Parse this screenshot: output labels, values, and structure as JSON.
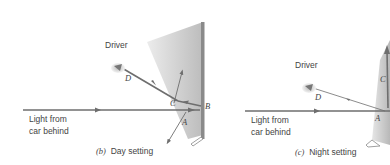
{
  "figure": {
    "panels": [
      {
        "id": "b",
        "caption_letter": "(b)",
        "caption_text": "Day setting",
        "driver_label": "Driver",
        "light_label_line1": "Light from",
        "light_label_line2": "car behind",
        "points": {
          "A": "A",
          "B": "B",
          "C": "C",
          "D": "D"
        }
      },
      {
        "id": "c",
        "caption_letter": "(c)",
        "caption_text": "Night setting",
        "driver_label": "Driver",
        "light_label_line1": "Light from",
        "light_label_line2": "car behind",
        "points": {
          "A": "A",
          "C": "C",
          "D": "D"
        }
      }
    ],
    "colors": {
      "ray": "#6e6e6e",
      "mirror_back": "#8a8a8a",
      "wedge_light": "#e4e4e4",
      "wedge_dark": "#bdbdbd",
      "text": "#444444"
    }
  }
}
